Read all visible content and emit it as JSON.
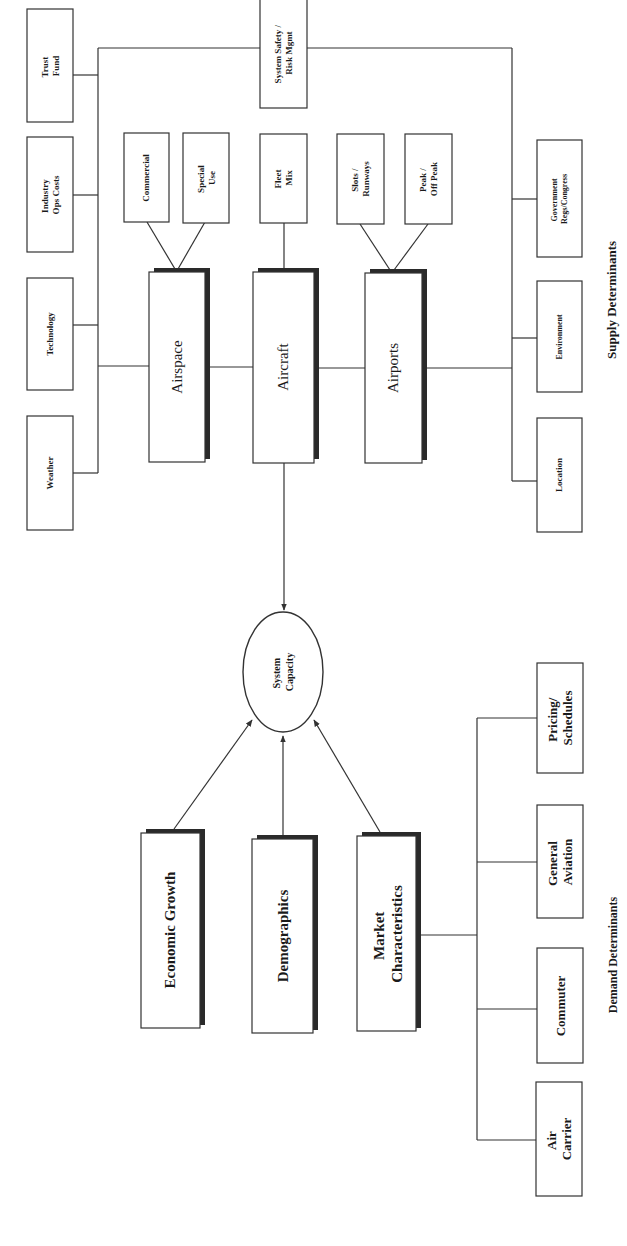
{
  "diagram": {
    "title_supply": "Supply Determinants",
    "title_demand": "Demand Determinants",
    "center": {
      "label_lines": [
        "System",
        "Capacity"
      ]
    },
    "supply": {
      "main": [
        {
          "id": "airspace",
          "label": "Airspace"
        },
        {
          "id": "aircraft",
          "label": "Aircraft"
        },
        {
          "id": "airports",
          "label": "Airports"
        }
      ],
      "sub": [
        {
          "id": "commercial",
          "lines": [
            "Commercial"
          ],
          "parent": "airspace"
        },
        {
          "id": "special-use",
          "lines": [
            "Special",
            "Use"
          ],
          "parent": "airspace"
        },
        {
          "id": "fleet-mix",
          "lines": [
            "Fleet",
            "Mix"
          ],
          "parent": "aircraft"
        },
        {
          "id": "slots-runways",
          "lines": [
            "Slots /",
            "Runways"
          ],
          "parent": "airports"
        },
        {
          "id": "peak-off-peak",
          "lines": [
            "Peak /",
            "Off Peak"
          ],
          "parent": "airports"
        }
      ],
      "external_left": [
        {
          "id": "trust-fund",
          "lines": [
            "Trust",
            "Fund"
          ]
        },
        {
          "id": "industry-ops-costs",
          "lines": [
            "Industry",
            "Ops Costs"
          ]
        },
        {
          "id": "technology",
          "lines": [
            "Technology"
          ]
        },
        {
          "id": "weather",
          "lines": [
            "Weather"
          ]
        }
      ],
      "external_top": {
        "id": "system-safety",
        "lines": [
          "System Safety /",
          "Risk Mgmt"
        ]
      },
      "external_right": [
        {
          "id": "government",
          "lines": [
            "Government",
            "Regs/Congress"
          ]
        },
        {
          "id": "environment",
          "lines": [
            "Environment"
          ]
        },
        {
          "id": "location",
          "lines": [
            "Location"
          ]
        }
      ]
    },
    "demand": {
      "main": [
        {
          "id": "economic-growth",
          "lines": [
            "Economic Growth"
          ]
        },
        {
          "id": "demographics",
          "lines": [
            "Demographics"
          ]
        },
        {
          "id": "market-characteristics",
          "lines": [
            "Market",
            "Characteristics"
          ]
        }
      ],
      "segments": [
        {
          "id": "pricing-schedules",
          "lines": [
            "Pricing/",
            "Schedules"
          ]
        },
        {
          "id": "general-aviation",
          "lines": [
            "General",
            "Aviation"
          ]
        },
        {
          "id": "commuter",
          "lines": [
            "Commuter"
          ]
        },
        {
          "id": "air-carrier",
          "lines": [
            "Air",
            "Carrier"
          ]
        }
      ]
    }
  }
}
